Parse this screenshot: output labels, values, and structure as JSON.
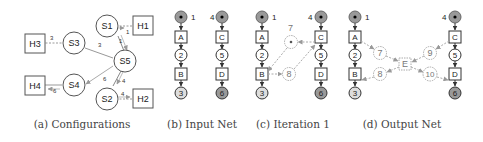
{
  "figure": {
    "panels": [
      {
        "id": "a",
        "caption": "(a) Configurations",
        "nodes": {
          "switches": [
            "S1",
            "S2",
            "S3",
            "S4",
            "S5"
          ],
          "hosts": [
            "H1",
            "H2",
            "H3",
            "H4"
          ]
        },
        "edge_labels": {
          "h1_s1": "1",
          "s1_s5": "1",
          "s3_s5": "3",
          "h3_s3": "3",
          "s5_s4": "6",
          "s4_h4": "6",
          "s5_s2": "4",
          "s2_h2": "4"
        }
      },
      {
        "id": "b",
        "caption": "(b) Input Net",
        "left_column": [
          "1",
          "A",
          "2",
          "B",
          "3"
        ],
        "right_column": [
          "4",
          "C",
          "5",
          "D",
          "6"
        ]
      },
      {
        "id": "c",
        "caption": "(c) Iteration 1",
        "left_column": [
          "1",
          "A",
          "2",
          "B",
          "3"
        ],
        "right_column": [
          "4",
          "C",
          "5",
          "D",
          "6"
        ],
        "new_places": [
          "7",
          "8"
        ]
      },
      {
        "id": "d",
        "caption": "(d) Output Net",
        "left_column": [
          "1",
          "A",
          "2",
          "B",
          "3"
        ],
        "right_column": [
          "4",
          "C",
          "5",
          "D",
          "6"
        ],
        "new_places": [
          "7",
          "8",
          "9",
          "10"
        ],
        "new_transition": "E"
      }
    ]
  }
}
